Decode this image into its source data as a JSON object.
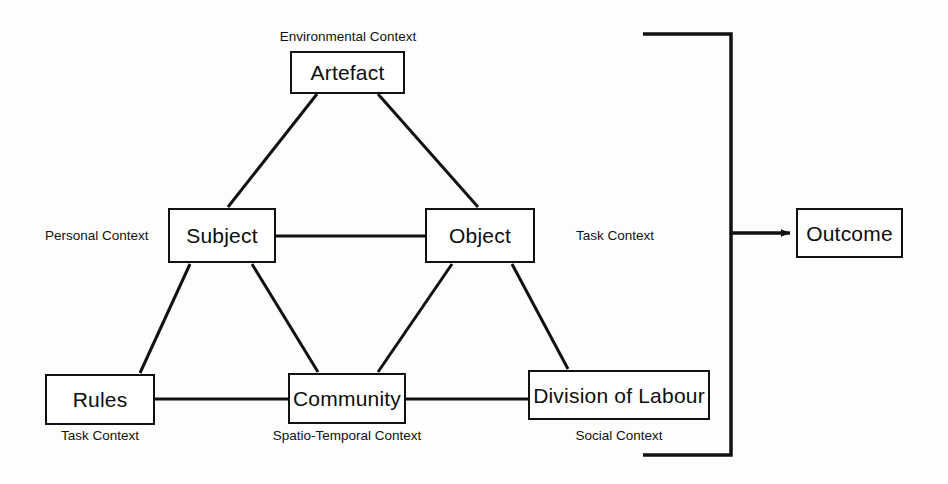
{
  "diagram": {
    "stroke_color": "#111111",
    "fill_color": "#ffffff",
    "background_color": "#fdfdfc",
    "nodes": [
      {
        "id": "artefact",
        "label": "Artefact"
      },
      {
        "id": "subject",
        "label": "Subject"
      },
      {
        "id": "object",
        "label": "Object"
      },
      {
        "id": "rules",
        "label": "Rules"
      },
      {
        "id": "community",
        "label": "Community"
      },
      {
        "id": "division",
        "label": "Division of Labour"
      },
      {
        "id": "outcome",
        "label": "Outcome"
      }
    ],
    "context_labels": [
      {
        "id": "environmental",
        "text": "Environmental Context",
        "attached_to": "artefact",
        "position": "above"
      },
      {
        "id": "personal",
        "text": "Personal Context",
        "attached_to": "subject",
        "position": "left"
      },
      {
        "id": "task_object",
        "text": "Task Context",
        "attached_to": "object",
        "position": "right"
      },
      {
        "id": "task_rules",
        "text": "Task Context",
        "attached_to": "rules",
        "position": "below"
      },
      {
        "id": "spatio",
        "text": "Spatio-Temporal Context",
        "attached_to": "community",
        "position": "below"
      },
      {
        "id": "social",
        "text": "Social Context",
        "attached_to": "division",
        "position": "below"
      }
    ],
    "edges": [
      {
        "from": "artefact",
        "to": "subject",
        "type": "line"
      },
      {
        "from": "artefact",
        "to": "object",
        "type": "line"
      },
      {
        "from": "subject",
        "to": "object",
        "type": "line"
      },
      {
        "from": "subject",
        "to": "rules",
        "type": "line"
      },
      {
        "from": "subject",
        "to": "community",
        "type": "line"
      },
      {
        "from": "object",
        "to": "community",
        "type": "line"
      },
      {
        "from": "object",
        "to": "division",
        "type": "line"
      },
      {
        "from": "rules",
        "to": "community",
        "type": "line"
      },
      {
        "from": "community",
        "to": "division",
        "type": "line"
      },
      {
        "from": "system",
        "to": "outcome",
        "type": "arrow-bracket"
      }
    ]
  }
}
